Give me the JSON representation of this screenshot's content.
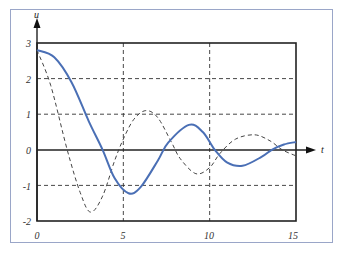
{
  "chart_data": {
    "type": "line",
    "title": "",
    "xlabel": "t",
    "ylabel": "u",
    "xlim": [
      0,
      15
    ],
    "ylim": [
      -2,
      3
    ],
    "grid": true,
    "x_ticks": [
      "0",
      "5",
      "10",
      "15"
    ],
    "y_ticks": [
      "3",
      "2",
      "1",
      "0",
      "-1",
      "-2"
    ],
    "series": [
      {
        "name": "solid",
        "style": "solid",
        "color": "#4a6fb5",
        "points": [
          [
            0,
            2.8
          ],
          [
            1,
            2.6
          ],
          [
            2,
            1.9
          ],
          [
            3,
            0.8
          ],
          [
            3.8,
            0
          ],
          [
            4.5,
            -0.8
          ],
          [
            5.3,
            -1.22
          ],
          [
            6,
            -1.05
          ],
          [
            7,
            -0.3
          ],
          [
            7.6,
            0.2
          ],
          [
            8.8,
            0.7
          ],
          [
            9.6,
            0.5
          ],
          [
            10.3,
            0
          ],
          [
            11,
            -0.35
          ],
          [
            11.9,
            -0.45
          ],
          [
            13,
            -0.2
          ],
          [
            13.6,
            0
          ],
          [
            14.3,
            0.15
          ],
          [
            15,
            0.22
          ]
        ]
      },
      {
        "name": "dashed",
        "style": "dashed",
        "color": "#444444",
        "points": [
          [
            0,
            2.8
          ],
          [
            0.8,
            1.8
          ],
          [
            1.75,
            0
          ],
          [
            2.5,
            -1.2
          ],
          [
            3.1,
            -1.75
          ],
          [
            3.8,
            -1.3
          ],
          [
            4.5,
            -0.3
          ],
          [
            5,
            0.3
          ],
          [
            5.6,
            0.85
          ],
          [
            6.3,
            1.1
          ],
          [
            7,
            0.9
          ],
          [
            7.8,
            0.2
          ],
          [
            8.3,
            -0.25
          ],
          [
            9.2,
            -0.67
          ],
          [
            10,
            -0.5
          ],
          [
            10.6,
            -0.1
          ],
          [
            11.5,
            0.3
          ],
          [
            12.6,
            0.42
          ],
          [
            13.5,
            0.25
          ],
          [
            14.2,
            0
          ],
          [
            15,
            -0.17
          ]
        ]
      }
    ]
  },
  "axes": {
    "x_label": "t",
    "y_label": "u"
  },
  "ticks": {
    "x": [
      "0",
      "5",
      "10",
      "15"
    ],
    "y": [
      "3",
      "2",
      "1",
      "0",
      "-1",
      "-2"
    ]
  }
}
